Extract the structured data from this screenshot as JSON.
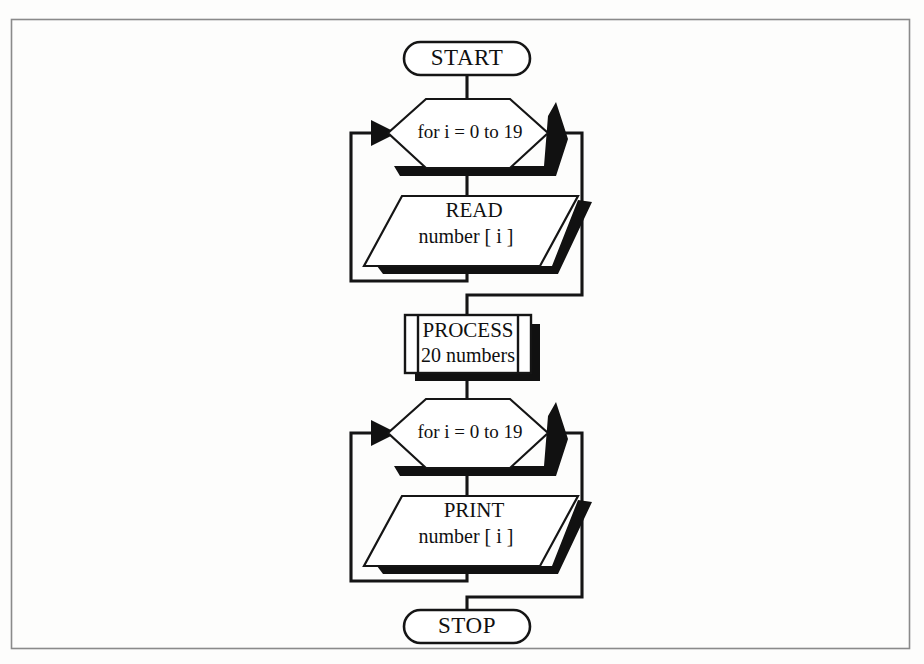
{
  "page": {
    "background_color": "#fdfdfc",
    "frame_color": "#8a8a8a",
    "ink_color": "#151515",
    "shadow_color": "#111111"
  },
  "diagram": {
    "type": "flowchart",
    "orientation": "top-to-bottom",
    "nodes": [
      {
        "id": "start",
        "shape": "terminator",
        "label": "START"
      },
      {
        "id": "loop1",
        "shape": "hexagon-loop",
        "label": "for i = 0 to 19"
      },
      {
        "id": "read",
        "shape": "parallelogram-io",
        "line1": "READ",
        "line2": "number [ i ]"
      },
      {
        "id": "proc",
        "shape": "predefined-process",
        "line1": "PROCESS",
        "line2": "20 numbers"
      },
      {
        "id": "loop2",
        "shape": "hexagon-loop",
        "label": "for i = 0 to 19"
      },
      {
        "id": "print",
        "shape": "parallelogram-io",
        "line1": "PRINT",
        "line2": "number [ i ]"
      },
      {
        "id": "stop",
        "shape": "terminator",
        "label": "STOP"
      }
    ],
    "edges": [
      {
        "from": "start",
        "to": "loop1",
        "kind": "straight"
      },
      {
        "from": "loop1",
        "to": "read",
        "kind": "straight"
      },
      {
        "from": "read",
        "to": "loop1",
        "kind": "loop-back-left",
        "arrowhead": "left-vertex"
      },
      {
        "from": "loop1",
        "to": "proc",
        "kind": "loop-exit-right"
      },
      {
        "from": "proc",
        "to": "loop2",
        "kind": "straight"
      },
      {
        "from": "loop2",
        "to": "print",
        "kind": "straight"
      },
      {
        "from": "print",
        "to": "loop2",
        "kind": "loop-back-left",
        "arrowhead": "left-vertex"
      },
      {
        "from": "loop2",
        "to": "stop",
        "kind": "loop-exit-right"
      }
    ]
  }
}
